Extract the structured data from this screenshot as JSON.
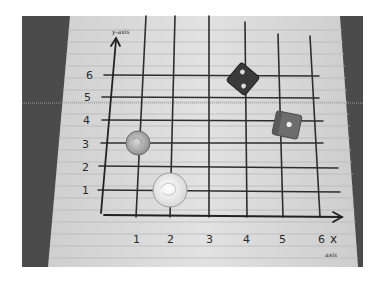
{
  "photo": {
    "description": "Photograph of a hand-drawn coordinate grid on lined notebook paper with two coins and two dice placed on it",
    "colors": {
      "background": "#ffffff",
      "table_dark": "#4a4a4a",
      "paper": "#dcdcdc",
      "paper_rule": "#b8b8b8",
      "ink": "#2a2a2a"
    }
  },
  "axes": {
    "y_label": "y-axis",
    "x_label": "x",
    "x_sublabel": "axis",
    "x_ticks": [
      "1",
      "2",
      "3",
      "4",
      "5",
      "6"
    ],
    "y_ticks": [
      "1",
      "2",
      "3",
      "4",
      "5",
      "6"
    ]
  },
  "objects": [
    {
      "type": "dime",
      "x": 1,
      "y": 3
    },
    {
      "type": "coin",
      "x": 2,
      "y": 1
    },
    {
      "type": "die",
      "shade": "dark",
      "pips": 2,
      "x": 4,
      "y": 6
    },
    {
      "type": "die",
      "shade": "light",
      "pips": 1,
      "x": 5,
      "y": 4
    }
  ]
}
